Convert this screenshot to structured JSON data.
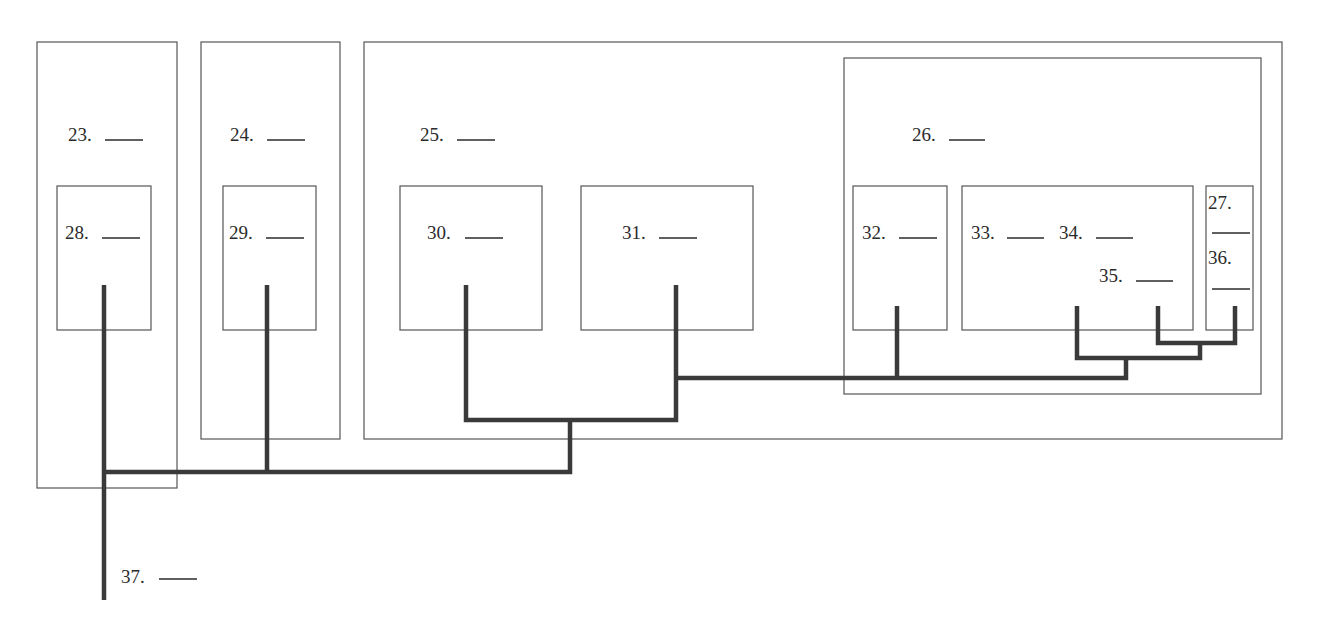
{
  "diagram": {
    "type": "hierarchy-tree",
    "blank": "____",
    "labels": {
      "n23": "23.",
      "n24": "24.",
      "n25": "25.",
      "n26": "26.",
      "n27": "27.",
      "n28": "28.",
      "n29": "29.",
      "n30": "30.",
      "n31": "31.",
      "n32": "32.",
      "n33": "33.",
      "n34": "34.",
      "n35": "35.",
      "n36": "36.",
      "n37": "37."
    },
    "groups": [
      {
        "id": "23",
        "contains": [
          "28"
        ]
      },
      {
        "id": "24",
        "contains": [
          "29"
        ]
      },
      {
        "id": "25",
        "contains": [
          "30",
          "31",
          "26"
        ]
      },
      {
        "id": "26",
        "contains": [
          "32",
          "33",
          "27"
        ]
      },
      {
        "id": "33",
        "contains": [
          "34",
          "35"
        ]
      },
      {
        "id": "27",
        "contains": [
          "36"
        ]
      }
    ],
    "root": "37"
  }
}
